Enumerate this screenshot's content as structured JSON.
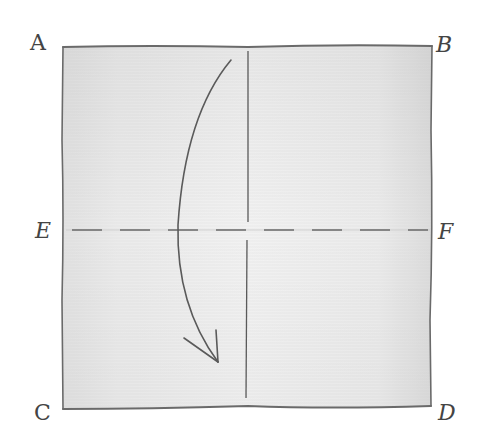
{
  "diagram": {
    "type": "origami-fold-step",
    "paper": {
      "shape": "square",
      "fill_color": "#e6e6e6",
      "edge_color": "#6a6a6a"
    },
    "corners": {
      "top_left": "A",
      "top_right": "B",
      "bottom_left": "C",
      "bottom_right": "D"
    },
    "midpoints": {
      "left": "E",
      "right": "F"
    },
    "lines": [
      {
        "name": "fold-line-ef",
        "style": "dashed",
        "from": "E",
        "to": "F",
        "meaning": "valley fold"
      },
      {
        "name": "center-crease",
        "style": "solid",
        "orientation": "vertical",
        "meaning": "existing crease"
      }
    ],
    "arrow": {
      "direction": "down",
      "meaning": "fold top edge AB down to bottom edge CD along EF"
    },
    "colors": {
      "ink": "#5a5a5a",
      "label": "#444444",
      "paper": "#e6e6e6",
      "background": "#ffffff"
    }
  }
}
